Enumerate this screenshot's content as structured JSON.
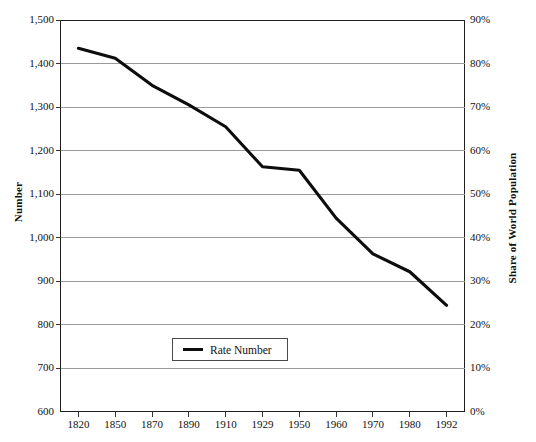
{
  "chart_data": {
    "type": "line",
    "title": "",
    "xlabel": "",
    "ylabel": "Number",
    "y2label": "Share of World Population",
    "grid": true,
    "legend_position": "inside-bottom-left",
    "x": [
      "1820",
      "1850",
      "1870",
      "1890",
      "1910",
      "1929",
      "1950",
      "1960",
      "1970",
      "1980",
      "1992"
    ],
    "categories": [
      "1820",
      "1850",
      "1870",
      "1890",
      "1910",
      "1929",
      "1950",
      "1960",
      "1970",
      "1980",
      "1992"
    ],
    "series": [
      {
        "name": "Rate Number",
        "values": [
          1435,
          1412,
          1350,
          1305,
          1255,
          1163,
          1155,
          1045,
          963,
          922,
          845
        ]
      }
    ],
    "values": [
      1435,
      1412,
      1350,
      1305,
      1255,
      1163,
      1155,
      1045,
      963,
      922,
      845
    ],
    "ylim": [
      600,
      1500
    ],
    "ytick_values": [
      600,
      700,
      800,
      900,
      1000,
      1100,
      1200,
      1300,
      1400,
      1500
    ],
    "ytick_labels": [
      "600",
      "700",
      "800",
      "900",
      "1,000",
      "1,100",
      "1,200",
      "1,300",
      "1,400",
      "1,500"
    ],
    "y2lim": [
      0,
      90
    ],
    "y2tick_values": [
      0,
      10,
      20,
      30,
      40,
      50,
      60,
      70,
      80,
      90
    ],
    "y2tick_labels": [
      "0%",
      "10%",
      "20%",
      "30%",
      "40%",
      "50%",
      "60%",
      "70%",
      "80%",
      "90%"
    ],
    "line_color": "#0d0d0d",
    "grid_color": "#9a9a9a",
    "frame_color": "#231f20",
    "background_color": "#ffffff"
  },
  "legend": {
    "entries": [
      {
        "label": "Rate Number",
        "color": "#0d0d0d"
      }
    ]
  },
  "axes": {
    "left_title": "Number",
    "right_title": "Share of World Population"
  }
}
